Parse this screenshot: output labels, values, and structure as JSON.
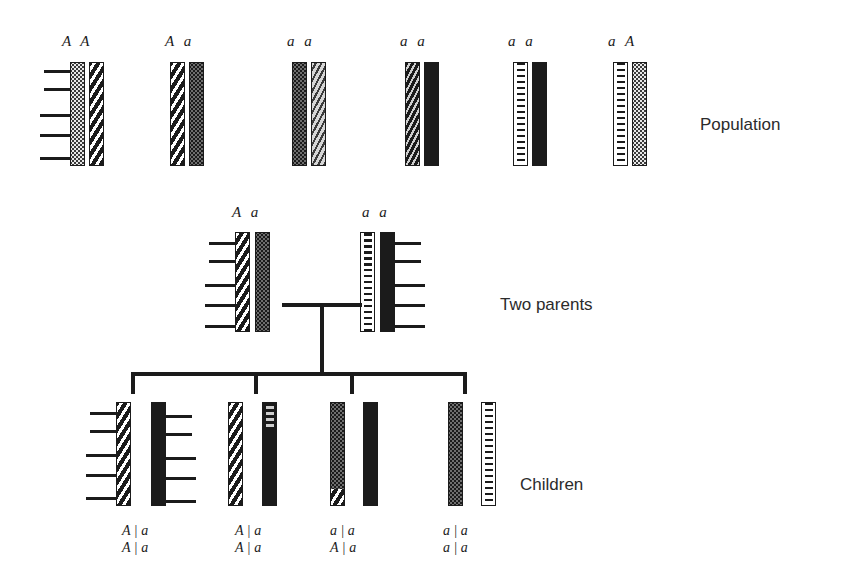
{
  "figure": {
    "sections": [
      {
        "id": "population",
        "caption": "Population",
        "caption_x": 700,
        "caption_y": 115
      },
      {
        "id": "parents",
        "caption": "Two parents",
        "caption_x": 500,
        "caption_y": 295
      },
      {
        "id": "children",
        "caption": "Children",
        "caption_x": 520,
        "caption_y": 475
      }
    ]
  },
  "population": {
    "label_y": 33,
    "bar_y": 62,
    "bar_h": 104,
    "bar_w": 15,
    "individuals": [
      {
        "genotype": "A A",
        "label_x": 62,
        "bars": [
          {
            "x": 70,
            "pattern": "light",
            "allele": "A"
          },
          {
            "x": 89,
            "pattern": "diag",
            "allele": "A"
          }
        ],
        "ticks_side": "left",
        "ticks": [
          8,
          26,
          52,
          72,
          95
        ]
      },
      {
        "genotype": "A a",
        "label_x": 165,
        "bars": [
          {
            "x": 170,
            "pattern": "diag",
            "allele": "A"
          },
          {
            "x": 189,
            "pattern": "stipple",
            "allele": "a"
          }
        ],
        "ticks_side": "none",
        "ticks": []
      },
      {
        "genotype": "a a",
        "label_x": 287,
        "bars": [
          {
            "x": 292,
            "pattern": "stipple",
            "allele": "a"
          },
          {
            "x": 311,
            "pattern": "squiggle-light",
            "allele": "a"
          }
        ],
        "ticks_side": "none",
        "ticks": []
      },
      {
        "genotype": "a a",
        "label_x": 400,
        "bars": [
          {
            "x": 405,
            "pattern": "squiggle-dark",
            "allele": "a"
          },
          {
            "x": 424,
            "pattern": "solid",
            "allele": "a"
          }
        ],
        "ticks_side": "none",
        "ticks": []
      },
      {
        "genotype": "a a",
        "label_x": 508,
        "bars": [
          {
            "x": 513,
            "pattern": "ladder",
            "allele": "a"
          },
          {
            "x": 532,
            "pattern": "solid",
            "allele": "a"
          }
        ],
        "ticks_side": "none",
        "ticks": []
      },
      {
        "genotype": "a A",
        "label_x": 608,
        "bars": [
          {
            "x": 613,
            "pattern": "ladder",
            "allele": "a"
          },
          {
            "x": 632,
            "pattern": "light",
            "allele": "A"
          }
        ],
        "ticks_side": "none",
        "ticks": []
      }
    ]
  },
  "parents": {
    "label_y": 204,
    "bar_y": 232,
    "bar_h": 100,
    "bar_w": 15,
    "individuals": [
      {
        "genotype": "A a",
        "label_x": 232,
        "bars": [
          {
            "x": 235,
            "pattern": "diag",
            "allele": "A"
          },
          {
            "x": 255,
            "pattern": "stipple",
            "allele": "a"
          }
        ],
        "ticks_side": "left",
        "ticks": [
          10,
          28,
          52,
          72,
          93
        ]
      },
      {
        "genotype": "a a",
        "label_x": 362,
        "bars": [
          {
            "x": 360,
            "pattern": "ladder",
            "allele": "a"
          },
          {
            "x": 380,
            "pattern": "solid",
            "allele": "a"
          }
        ],
        "ticks_side": "right",
        "ticks": [
          10,
          28,
          52,
          72,
          93
        ]
      }
    ],
    "mating_line": {
      "x": 282,
      "y": 303,
      "w": 80,
      "h": 4
    },
    "descent_line": {
      "x": 320,
      "y": 303,
      "w": 4,
      "h": 70
    }
  },
  "children": {
    "bar_y": 402,
    "bar_h": 104,
    "bar_w": 15,
    "sib_bar": {
      "x": 131,
      "y": 372,
      "w": 336,
      "h": 4
    },
    "sib_drops": [
      {
        "x": 131,
        "y": 372,
        "h": 22
      },
      {
        "x": 254,
        "y": 372,
        "h": 22
      },
      {
        "x": 350,
        "y": 372,
        "h": 22
      },
      {
        "x": 463,
        "y": 372,
        "h": 22
      }
    ],
    "individuals": [
      {
        "geno_line1": "A | a",
        "geno_line2": "A | a",
        "geno_x": 122,
        "geno_y": 522,
        "bars": [
          {
            "x": 116,
            "pattern": "diag",
            "allele": "A"
          },
          {
            "x": 151,
            "pattern": "solid",
            "allele": "a"
          }
        ],
        "ticks_left": [
          10,
          28,
          52,
          72,
          95
        ],
        "ticks_right": [
          13,
          31,
          55,
          75,
          98
        ]
      },
      {
        "geno_line1": "A | a",
        "geno_line2": "A | a",
        "geno_x": 235,
        "geno_y": 522,
        "bars": [
          {
            "x": 228,
            "pattern": "diag",
            "allele": "A"
          },
          {
            "x": 262,
            "pattern": "solid",
            "allele": "a",
            "segments": [
              {
                "top": 0,
                "h": 24,
                "pattern": "ladder-dark"
              }
            ]
          }
        ],
        "ticks_left": [],
        "ticks_right": []
      },
      {
        "geno_line1": "a | a",
        "geno_line2": "A | a",
        "geno_x": 330,
        "geno_y": 522,
        "bars": [
          {
            "x": 330,
            "pattern": "stipple",
            "allele": "a",
            "segments": [
              {
                "top": 86,
                "h": 18,
                "pattern": "diag"
              }
            ]
          },
          {
            "x": 363,
            "pattern": "solid",
            "allele": "a"
          }
        ],
        "ticks_left": [],
        "ticks_right": []
      },
      {
        "geno_line1": "a | a",
        "geno_line2": "a | a",
        "geno_x": 443,
        "geno_y": 522,
        "bars": [
          {
            "x": 448,
            "pattern": "stipple",
            "allele": "a"
          },
          {
            "x": 481,
            "pattern": "ladder",
            "allele": "a"
          }
        ],
        "ticks_left": [],
        "ticks_right": []
      }
    ]
  }
}
